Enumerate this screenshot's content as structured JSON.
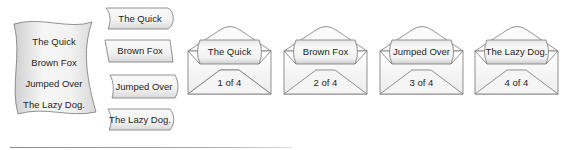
{
  "scroll": {
    "lines": [
      "The Quick",
      "Brown Fox",
      "Jumped Over",
      "The Lazy Dog."
    ]
  },
  "tags": [
    {
      "label": "The Quick"
    },
    {
      "label": "Brown Fox"
    },
    {
      "label": "Jumped Over"
    },
    {
      "label": "The Lazy Dog."
    }
  ],
  "envelopes": [
    {
      "label": "The Quick",
      "page": "1 of 4"
    },
    {
      "label": "Brown Fox",
      "page": "2 of 4"
    },
    {
      "label": "Jumped Over",
      "page": "3 of 4"
    },
    {
      "label": "The Lazy Dog.",
      "page": "4 of 4"
    }
  ],
  "colors": {
    "stroke": "#666666",
    "fill_light": "#f4f4f4",
    "fill_shade": "#d8d8d8"
  }
}
